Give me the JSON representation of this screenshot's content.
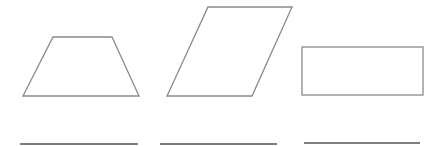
{
  "figure": {
    "stroke_color": "#8a8a8a",
    "line_color": "#555555",
    "background": "#ffffff",
    "shapes": [
      {
        "type": "trapezoid",
        "points": "53,37 112,37 139,96 23,96"
      },
      {
        "type": "parallelogram",
        "points": "208,7 292,7 252,96 167,96"
      },
      {
        "type": "rectangle",
        "x": 302,
        "y": 47,
        "width": 121,
        "height": 48
      }
    ],
    "answer_lines": [
      {
        "x1": 20,
        "x2": 138,
        "y": 144
      },
      {
        "x1": 160,
        "x2": 277,
        "y": 144
      },
      {
        "x1": 304,
        "x2": 420,
        "y": 143
      }
    ]
  }
}
